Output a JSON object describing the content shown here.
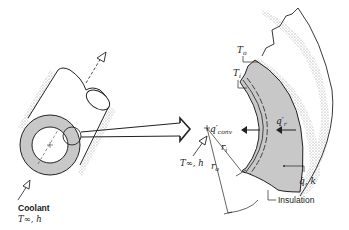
{
  "figure": {
    "left_view": {
      "description": "Insulated tube with coolant flowing through",
      "coolant_label": "Coolant",
      "coolant_props": "T∞, h"
    },
    "right_view": {
      "description": "Enlarged cross-section of insulation shell",
      "T_o": "T",
      "T_o_sub": "o",
      "T_i": "T",
      "T_i_sub": "i",
      "q_r": "q′",
      "q_r_sub": "r",
      "q_conv": "q′",
      "q_conv_sub": "conv",
      "T_inf_h": "T∞, h",
      "r_i": "r",
      "r_i_sub": "i",
      "r_o": "r",
      "r_o_sub": "o",
      "q_dot_k": "q̇, k",
      "insulation_label": "Insulation"
    },
    "colors": {
      "shell_fill": "#c8c8c8",
      "stroke": "#222222",
      "stipple": "#999999"
    }
  }
}
